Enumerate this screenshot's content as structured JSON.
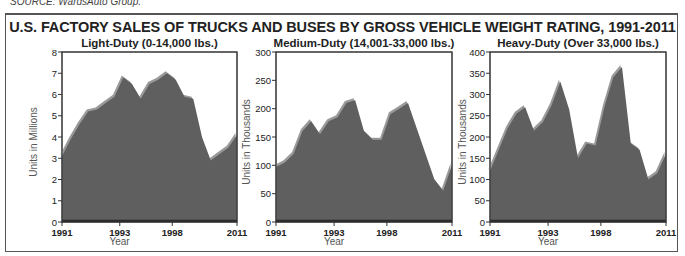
{
  "source_note": "SOURCE: WardsAuto Group.",
  "title": "U.S. FACTORY SALES OF TRUCKS AND BUSES BY GROSS VEHICLE WEIGHT RATING, 1991-2011",
  "colors": {
    "area_fill": "#5f5f5f",
    "area_highlight": "#9a9a9a",
    "axis": "#333333",
    "frame": "#555555"
  },
  "chart_data": [
    {
      "type": "area",
      "title": "Light-Duty (0-14,000 lbs.)",
      "xlabel": "Year",
      "ylabel": "Units in Millions",
      "ylim": [
        0,
        8
      ],
      "yticks": [
        0,
        1,
        2,
        3,
        4,
        5,
        6,
        7,
        8
      ],
      "xtick_labels": [
        "1991",
        "1993",
        "1998",
        "2011"
      ],
      "xtick_positions": [
        0,
        0.33,
        0.63,
        1
      ],
      "x": [
        1991,
        1992,
        1993,
        1994,
        1995,
        1996,
        1997,
        1998,
        1999,
        2000,
        2001,
        2002,
        2003,
        2004,
        2005,
        2006,
        2007,
        2008,
        2009,
        2010,
        2011
      ],
      "values": [
        3.1,
        3.9,
        4.6,
        5.2,
        5.3,
        5.6,
        5.9,
        6.8,
        6.5,
        5.8,
        6.5,
        6.7,
        7.0,
        6.7,
        5.9,
        5.8,
        4.0,
        2.9,
        3.2,
        3.5,
        4.1
      ],
      "grid": false,
      "legend": null
    },
    {
      "type": "area",
      "title": "Medium-Duty (14,001-33,000 lbs.)",
      "xlabel": "Year",
      "ylabel": "Units in Thousands",
      "ylim": [
        0,
        300
      ],
      "yticks": [
        0,
        50,
        100,
        150,
        200,
        250,
        300
      ],
      "xtick_labels": [
        "1991",
        "1993",
        "1998",
        "2011"
      ],
      "xtick_positions": [
        0,
        0.33,
        0.63,
        1
      ],
      "x": [
        1991,
        1992,
        1993,
        1994,
        1995,
        1996,
        1997,
        1998,
        1999,
        2000,
        2001,
        2002,
        2003,
        2004,
        2005,
        2006,
        2007,
        2008,
        2009,
        2010,
        2011
      ],
      "values": [
        97,
        105,
        120,
        160,
        178,
        155,
        178,
        185,
        210,
        215,
        160,
        145,
        145,
        190,
        200,
        210,
        165,
        120,
        75,
        55,
        100
      ],
      "grid": false,
      "legend": null
    },
    {
      "type": "area",
      "title": "Heavy-Duty (Over 33,000 lbs.)",
      "xlabel": "Year",
      "ylabel": "Units in Thousands",
      "ylim": [
        0,
        400
      ],
      "yticks": [
        0,
        50,
        100,
        150,
        200,
        250,
        300,
        350,
        400
      ],
      "xtick_labels": [
        "1991",
        "1993",
        "1998",
        "2011"
      ],
      "xtick_positions": [
        0,
        0.33,
        0.63,
        1
      ],
      "x": [
        1991,
        1992,
        1993,
        1994,
        1995,
        1996,
        1997,
        1998,
        1999,
        2000,
        2001,
        2002,
        2003,
        2004,
        2005,
        2006,
        2007,
        2008,
        2009,
        2010,
        2011
      ],
      "values": [
        120,
        170,
        220,
        255,
        270,
        215,
        235,
        275,
        330,
        265,
        150,
        185,
        180,
        270,
        340,
        365,
        185,
        170,
        100,
        115,
        160
      ],
      "grid": false,
      "legend": null
    }
  ]
}
